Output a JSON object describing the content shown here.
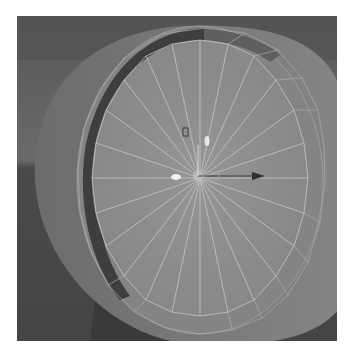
{
  "viewport": {
    "label": "3D viewport - wheel mesh",
    "object": "wheel",
    "segments": 24,
    "colors": {
      "background_top": "#606060",
      "background_bottom": "#454545",
      "mesh_face": "#8c8c8c",
      "mesh_side": "#7a7a7a",
      "inset_ring": "#404040",
      "wireframe": "#c8c8c8"
    }
  },
  "gizmo": {
    "type": "move-manipulator",
    "axes": [
      "x",
      "y",
      "z"
    ]
  }
}
